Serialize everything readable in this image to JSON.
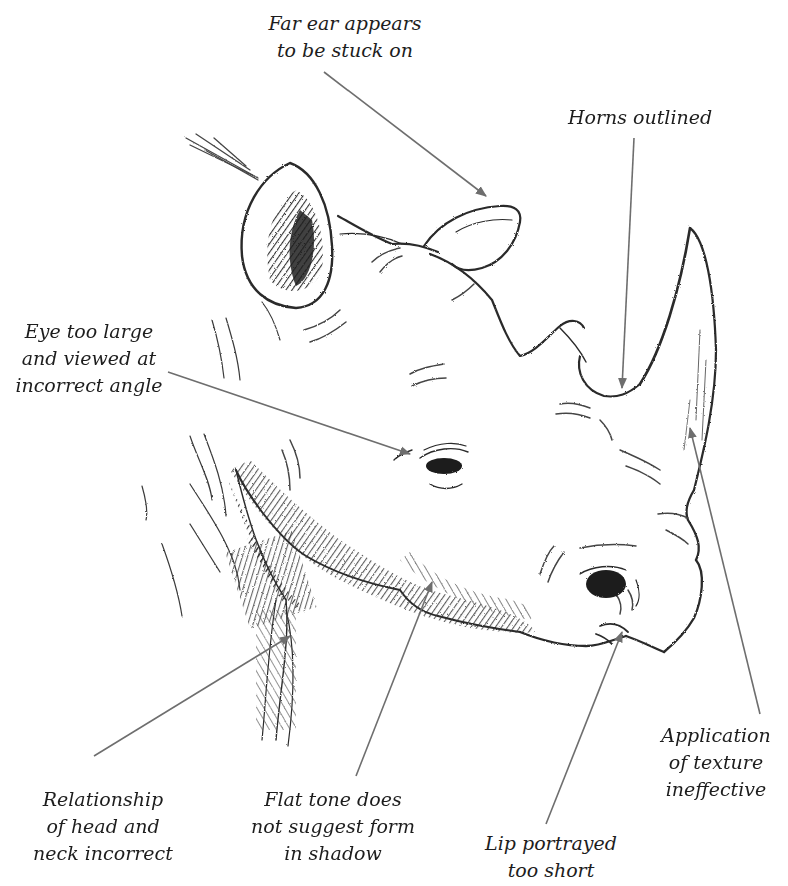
{
  "figure": {
    "colors": {
      "background": "#ffffff",
      "pencil": "#2a2a2a",
      "leader_line": "#6e6e6e",
      "text": "#1d1d1d"
    }
  },
  "annotations": [
    {
      "id": "far-ear",
      "lines": [
        "Far ear appears",
        "to be stuck on"
      ],
      "target": "far ear"
    },
    {
      "id": "horns",
      "lines": [
        "Horns outlined"
      ],
      "target": "rear horn base"
    },
    {
      "id": "eye",
      "lines": [
        "Eye too large",
        "and viewed at",
        "incorrect angle"
      ],
      "target": "eye"
    },
    {
      "id": "neck",
      "lines": [
        "Relationship",
        "of head and",
        "neck incorrect"
      ],
      "target": "neck"
    },
    {
      "id": "tone",
      "lines": [
        "Flat tone does",
        "not suggest form",
        "in shadow"
      ],
      "target": "jaw shadow"
    },
    {
      "id": "lip",
      "lines": [
        "Lip portrayed",
        "too short"
      ],
      "target": "lip"
    },
    {
      "id": "texture",
      "lines": [
        "Application",
        "of texture",
        "ineffective"
      ],
      "target": "front horn"
    }
  ]
}
